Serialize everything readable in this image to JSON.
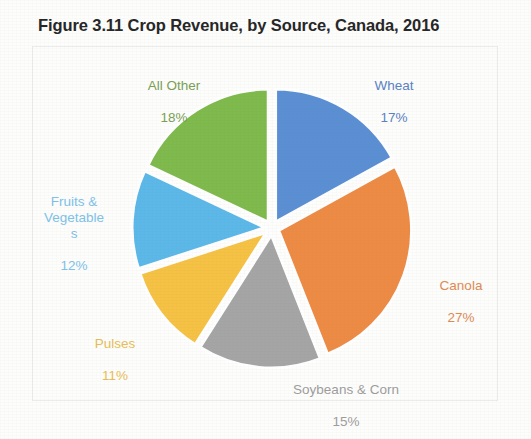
{
  "chart_data": {
    "type": "pie",
    "title": "Figure 3.11 Crop Revenue, by Source, Canada, 2016",
    "xlabel": "",
    "ylabel": "",
    "legend": "none",
    "grid": false,
    "exploded": true,
    "start_angle_deg": 0,
    "direction": "clockwise",
    "categories": [
      "Wheat",
      "Canola",
      "Soybeans & Corn",
      "Pulses",
      "Fruits & Vegetables",
      "All Other"
    ],
    "values": [
      17,
      27,
      15,
      11,
      12,
      18
    ],
    "value_unit": "%",
    "colors": [
      "#5B8FD4",
      "#ED8B44",
      "#A5A5A5",
      "#F6C244",
      "#5BB8E8",
      "#7FBA4C"
    ],
    "slices": [
      {
        "label": "Wheat",
        "value": 17,
        "value_text": "17%",
        "color": "#5B8FD4",
        "label_color": "#5a82c4"
      },
      {
        "label": "Canola",
        "value": 27,
        "value_text": "27%",
        "color": "#ED8B44",
        "label_color": "#e08a52"
      },
      {
        "label": "Soybeans & Corn",
        "value": 15,
        "value_text": "15%",
        "color": "#A5A5A5",
        "label_color": "#9d9d9d"
      },
      {
        "label": "Pulses",
        "value": 11,
        "value_text": "11%",
        "color": "#F6C244",
        "label_color": "#e9bd55"
      },
      {
        "label": "Fruits & Vegetables",
        "value": 12,
        "value_text": "12%",
        "color": "#5BB8E8",
        "label_color": "#7ec2e8",
        "label_wrapped": "Fruits &\nVegetable\ns"
      },
      {
        "label": "All Other",
        "value": 18,
        "value_text": "18%",
        "color": "#7FBA4C",
        "label_color": "#7a9f55"
      }
    ]
  },
  "figure": {
    "title": "Figure 3.11 Crop Revenue, by Source, Canada, 2016",
    "border_color": "#ececed",
    "background": "#fdfdfc"
  },
  "labels": {
    "all_other": {
      "name": "All Other",
      "pct": "18%"
    },
    "wheat": {
      "name": "Wheat",
      "pct": "17%"
    },
    "canola": {
      "name": "Canola",
      "pct": "27%"
    },
    "soybeans": {
      "name": "Soybeans & Corn",
      "pct": "15%"
    },
    "pulses": {
      "name": "Pulses",
      "pct": "11%"
    },
    "fruits": {
      "name": "Fruits &\nVegetable\ns",
      "pct": "12%"
    }
  }
}
